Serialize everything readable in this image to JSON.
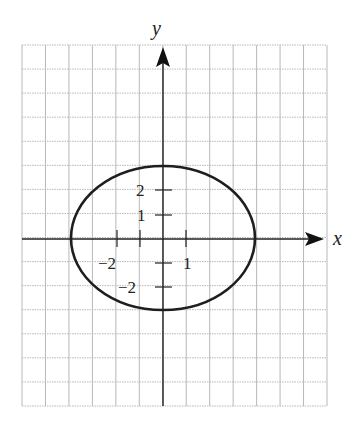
{
  "chart_data": {
    "type": "line",
    "title": "",
    "equation": "x^2/16 + y^2/9 = 1",
    "center": [
      0,
      0
    ],
    "semi_axis_x": 4,
    "semi_axis_y": 3,
    "xlabel": "x",
    "ylabel": "y",
    "xlim": [
      -6,
      7
    ],
    "ylim": [
      -7,
      8
    ],
    "grid": true,
    "x_ticks": [
      -2,
      -1,
      1
    ],
    "x_tick_labels": [
      {
        "value": -2,
        "text": "−2"
      },
      {
        "value": 1,
        "text": "1"
      }
    ],
    "y_ticks": [
      -2,
      -1,
      1,
      2
    ],
    "y_tick_labels": [
      {
        "value": 2,
        "text": "2"
      },
      {
        "value": 1,
        "text": "1"
      },
      {
        "value": -2,
        "text": "−2"
      }
    ],
    "series": [
      {
        "name": "ellipse",
        "points": [
          [
            4,
            0
          ],
          [
            0,
            3
          ],
          [
            -4,
            0
          ],
          [
            0,
            -3
          ]
        ]
      }
    ]
  },
  "labels": {
    "x_axis": "x",
    "y_axis": "y",
    "x_neg2": "−2",
    "x_pos1": "1",
    "y_pos2": "2",
    "y_pos1": "1",
    "y_neg2": "−2"
  },
  "colors": {
    "grid": "#b8b8b8",
    "axis": "#222222",
    "curve": "#1e1e1e"
  }
}
